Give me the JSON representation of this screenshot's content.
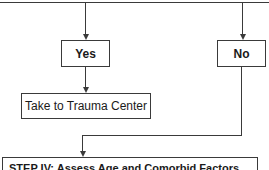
{
  "diagram": {
    "type": "flowchart",
    "nodes": {
      "yes": {
        "label": "Yes"
      },
      "no": {
        "label": "No"
      },
      "trauma_center": {
        "label": "Take to Trauma Center"
      },
      "step4": {
        "label": "STEP IV: Assess Age and Comorbid Factors"
      }
    },
    "edges": [
      {
        "from": "decision-above",
        "to": "yes"
      },
      {
        "from": "decision-above",
        "to": "no"
      },
      {
        "from": "yes",
        "to": "trauma_center"
      },
      {
        "from": "no",
        "to": "step4"
      }
    ],
    "colors": {
      "line": "#3a3a3a",
      "background": "#ffffff",
      "text": "#1a1a1a"
    }
  }
}
